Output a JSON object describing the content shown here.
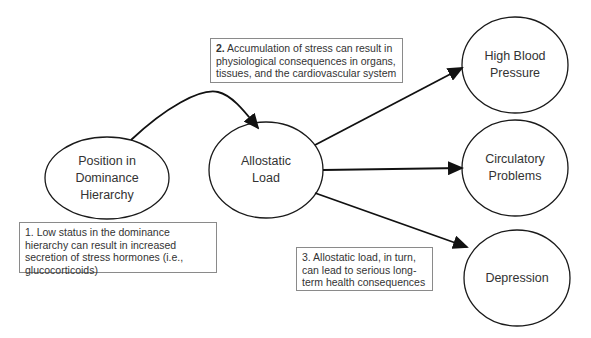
{
  "nodes": {
    "position": {
      "label": "Position in Dominance Hierarchy",
      "lines": [
        "Position in",
        "Dominance",
        "Hierarchy"
      ]
    },
    "allostatic": {
      "label": "Allostatic Load",
      "lines": [
        "Allostatic",
        "Load"
      ]
    },
    "hbp": {
      "label": "High Blood Pressure",
      "lines": [
        "High Blood",
        "Pressure"
      ]
    },
    "circulatory": {
      "label": "Circulatory Problems",
      "lines": [
        "Circulatory",
        "Problems"
      ]
    },
    "depression": {
      "label": "Depression",
      "lines": [
        "Depression"
      ]
    }
  },
  "notes": {
    "note1": {
      "number": "1.",
      "text": "Low status in the dominance hierarchy can result in increased secretion of stress hormones (i.e., glucocorticoids)"
    },
    "note2": {
      "number": "2.",
      "text": "Accumulation of stress can result in physiological consequences in organs, tissues, and the cardiovascular system"
    },
    "note3": {
      "number": "3.",
      "text": "Allostatic load, in turn, can lead to serious long-term health consequences"
    }
  },
  "edges": [
    {
      "from": "Position in Dominance Hierarchy",
      "to": "Allostatic Load",
      "style": "curved-arrow"
    },
    {
      "from": "Allostatic Load",
      "to": "High Blood Pressure",
      "style": "arrow"
    },
    {
      "from": "Allostatic Load",
      "to": "Circulatory Problems",
      "style": "arrow"
    },
    {
      "from": "Allostatic Load",
      "to": "Depression",
      "style": "arrow"
    }
  ],
  "colors": {
    "stroke": "#1a1a1a",
    "note_border": "#8a8a8a",
    "text": "#333333"
  }
}
